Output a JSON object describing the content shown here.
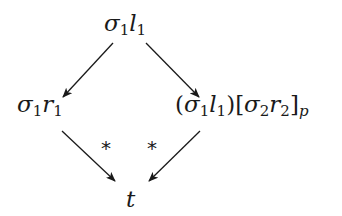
{
  "diagram": {
    "type": "commutative-diagram",
    "nodes": {
      "top": {
        "base1": "σ",
        "sub1": "1",
        "base2": "l",
        "sub2": "1"
      },
      "left": {
        "base1": "σ",
        "sub1": "1",
        "base2": "r",
        "sub2": "1"
      },
      "right": {
        "open_paren": "(",
        "base1": "σ",
        "sub1": "1",
        "base2": "l",
        "sub2": "1",
        "close_paren": ")",
        "open_bracket": "[",
        "base3": "σ",
        "sub3": "2",
        "base4": "r",
        "sub4": "2",
        "close_bracket": "]",
        "sub_p": "p"
      },
      "bottom": {
        "label": "t"
      }
    },
    "edge_labels": {
      "left_star": "*",
      "right_star": "*"
    },
    "edges": [
      {
        "from": "top",
        "to": "left",
        "label": ""
      },
      {
        "from": "top",
        "to": "right",
        "label": ""
      },
      {
        "from": "left",
        "to": "bottom",
        "label": "*"
      },
      {
        "from": "right",
        "to": "bottom",
        "label": "*"
      }
    ],
    "colors": {
      "ink": "#1a1a1a",
      "background": "#ffffff"
    }
  }
}
